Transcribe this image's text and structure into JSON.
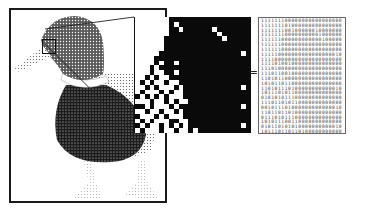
{
  "figure": {
    "equals_symbol": "=",
    "pixel_grid": {
      "rows": 24,
      "cols": 24,
      "encoding": "1 = white pixel, 0 = black pixel",
      "data": [
        "111111100000000000000000",
        "111111101000000000000000",
        "111111100100000010000000",
        "111111100000000001000000",
        "111111000000000000100000",
        "111111000000000000000000",
        "111111000000000000000000",
        "111110000000000000000010",
        "111100000000000000000000",
        "111101001000000000000000",
        "111010000000000000000000",
        "111011001000000000000000",
        "110101100000000000000000",
        "101011011000000000000000",
        "110101110100000000000010",
        "101110101100000000000000",
        "010101011100000000000000",
        "111011010110000000000000",
        "001011101000000000000010",
        "110110110100000000000000",
        "011101011100000000000000",
        "101011100110000000000000",
        "010110101010000000000010",
        "101110110110100000000000"
      ]
    }
  }
}
